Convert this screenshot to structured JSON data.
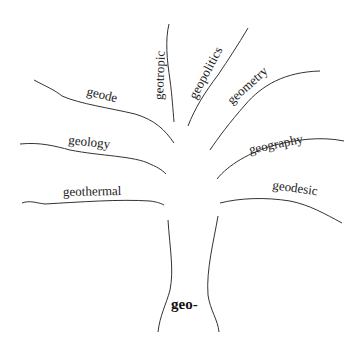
{
  "diagram": {
    "type": "word-tree",
    "root": "geo-",
    "branches": [
      {
        "label": "geotropic"
      },
      {
        "label": "geopolitics"
      },
      {
        "label": "geometry"
      },
      {
        "label": "geode"
      },
      {
        "label": "geology"
      },
      {
        "label": "geography"
      },
      {
        "label": "geothermal"
      },
      {
        "label": "geodesic"
      }
    ]
  }
}
